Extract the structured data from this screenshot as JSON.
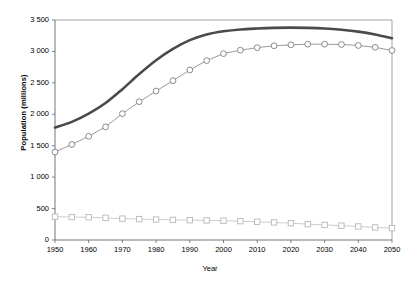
{
  "chart_data": {
    "type": "line",
    "title": "",
    "xlabel": "Year",
    "ylabel": "Population (millions)",
    "xlim": [
      1950,
      2050
    ],
    "ylim": [
      0,
      3500
    ],
    "grid": false,
    "legend": "none",
    "x": [
      1950,
      1955,
      1960,
      1965,
      1970,
      1975,
      1980,
      1985,
      1990,
      1995,
      2000,
      2005,
      2010,
      2015,
      2020,
      2025,
      2030,
      2035,
      2040,
      2045,
      2050
    ],
    "y_tick_labels": [
      "0",
      "500",
      "1 000",
      "1 500",
      "2 000",
      "2 500",
      "3 000",
      "3 500"
    ],
    "y_tick_values": [
      0,
      500,
      1000,
      1500,
      2000,
      2500,
      3000,
      3500
    ],
    "x_tick_labels": [
      "1950",
      "1960",
      "1970",
      "1980",
      "1990",
      "2000",
      "2010",
      "2020",
      "2030",
      "2040",
      "2050"
    ],
    "x_tick_values": [
      1950,
      1960,
      1970,
      1980,
      1990,
      2000,
      2010,
      2020,
      2030,
      2040,
      2050
    ],
    "series": [
      {
        "name": "thick-upper-line",
        "marker": "none",
        "color": "#4a4a4a",
        "line_width": 2.6,
        "values": [
          1790,
          1880,
          2010,
          2180,
          2400,
          2640,
          2860,
          3040,
          3180,
          3270,
          3320,
          3350,
          3365,
          3375,
          3378,
          3375,
          3365,
          3345,
          3315,
          3270,
          3210
        ]
      },
      {
        "name": "circle-marker-line",
        "marker": "circle",
        "color": "#6e6e6e",
        "line_width": 0.7,
        "values": [
          1400,
          1520,
          1650,
          1800,
          2010,
          2200,
          2370,
          2535,
          2705,
          2855,
          2965,
          3020,
          3060,
          3090,
          3105,
          3115,
          3115,
          3110,
          3095,
          3065,
          3015
        ]
      },
      {
        "name": "square-marker-line",
        "marker": "square",
        "color": "#b8b8b8",
        "line_width": 0.7,
        "values": [
          370,
          365,
          362,
          352,
          340,
          333,
          326,
          320,
          315,
          312,
          308,
          300,
          290,
          280,
          268,
          253,
          240,
          228,
          215,
          200,
          188
        ]
      }
    ]
  }
}
